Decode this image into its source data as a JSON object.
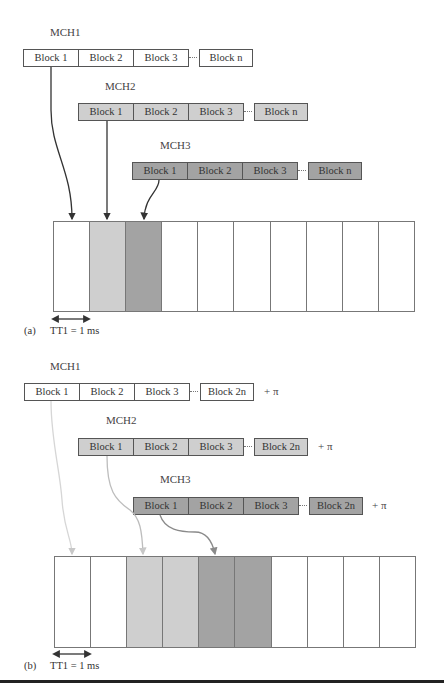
{
  "panel_a": {
    "channels": [
      {
        "name": "MCH1",
        "blocks": [
          "Block 1",
          "Block 2",
          "Block 3"
        ],
        "last_block": "Block n",
        "fill": "#ffffff"
      },
      {
        "name": "MCH2",
        "blocks": [
          "Block 1",
          "Block 2",
          "Block 3"
        ],
        "last_block": "Block n",
        "fill": "#cfcfcf"
      },
      {
        "name": "MCH3",
        "blocks": [
          "Block 1",
          "Block 2",
          "Block 3"
        ],
        "last_block": "Block n",
        "fill": "#a3a3a3"
      }
    ],
    "frame_slots": 10,
    "slot_fills": [
      "#ffffff",
      "#cfcfcf",
      "#a3a3a3",
      "#ffffff",
      "#ffffff",
      "#ffffff",
      "#ffffff",
      "#ffffff",
      "#ffffff",
      "#ffffff"
    ],
    "panel_label": "(a)",
    "tti_label": "TT1 = 1 ms"
  },
  "panel_b": {
    "channels": [
      {
        "name": "MCH1",
        "blocks": [
          "Block 1",
          "Block 2",
          "Block 3"
        ],
        "last_block": "Block 2n",
        "suffix": "+ π",
        "fill": "#ffffff"
      },
      {
        "name": "MCH2",
        "blocks": [
          "Block 1",
          "Block 2",
          "Block 3"
        ],
        "last_block": "Block 2n",
        "suffix": "+ π",
        "fill": "#cfcfcf"
      },
      {
        "name": "MCH3",
        "blocks": [
          "Block 1",
          "Block 2",
          "Block 3"
        ],
        "last_block": "Block 2n",
        "suffix": "+ π",
        "fill": "#a3a3a3"
      }
    ],
    "frame_slots": 10,
    "slot_fills": [
      "#ffffff",
      "#ffffff",
      "#cfcfcf",
      "#cfcfcf",
      "#a3a3a3",
      "#a3a3a3",
      "#ffffff",
      "#ffffff",
      "#ffffff",
      "#ffffff"
    ],
    "panel_label": "(b)",
    "tti_label": "TT1 = 1 ms"
  }
}
